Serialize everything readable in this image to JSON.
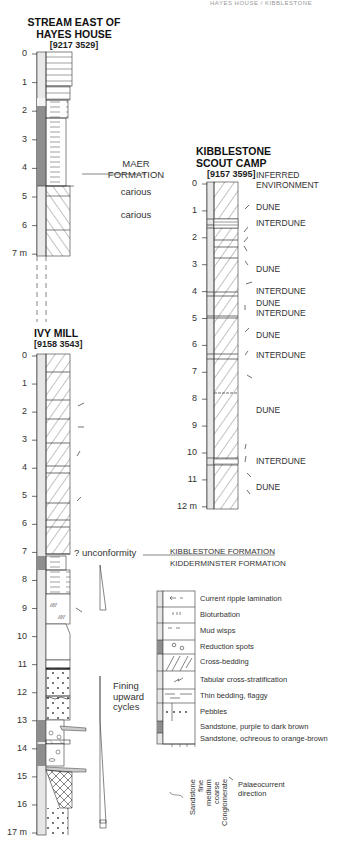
{
  "running_header": "HAYES HOUSE / KIBBLESTONE",
  "columns": [
    {
      "id": "stream-east",
      "title_lines": [
        "STREAM EAST OF",
        "HAYES HOUSE"
      ],
      "grid_ref": "[9217 3529]",
      "ticks": [
        "0",
        "1",
        "2",
        "3",
        "4",
        "5",
        "6",
        "7 m"
      ]
    },
    {
      "id": "ivy-mill",
      "title_lines": [
        "IVY MILL"
      ],
      "grid_ref": "[9158 3543]",
      "ticks": [
        "0",
        "1",
        "2",
        "3",
        "4",
        "5",
        "6",
        "7",
        "8",
        "9",
        "10",
        "11",
        "12",
        "13",
        "14",
        "15",
        "16",
        "17 m"
      ]
    },
    {
      "id": "kibblestone",
      "title_lines": [
        "KIBBLESTONE",
        "SCOUT CAMP"
      ],
      "grid_ref": "[9157 3595]",
      "ticks": [
        "0",
        "1",
        "2",
        "3",
        "4",
        "5",
        "6",
        "7",
        "8",
        "9",
        "10",
        "11",
        "12 m"
      ]
    }
  ],
  "annotations": {
    "maer_formation_lines": [
      "MAER",
      "FORMATION"
    ],
    "carious_1": "carious",
    "carious_2": "carious",
    "unconformity": "? unconformity",
    "kibblestone_formation": "KIBBLESTONE FORMATION",
    "kidderminster_formation": "KIDDERMINSTER FORMATION",
    "fining_upward": [
      "Fining",
      "upward",
      "cycles"
    ],
    "inferred_environment": [
      "INFERRED",
      "ENVIRONMENT"
    ]
  },
  "environments": [
    {
      "label": "DUNE",
      "depth": 0.9
    },
    {
      "label": "INTERDUNE",
      "depth": 1.5
    },
    {
      "label": "DUNE",
      "depth": 3.2
    },
    {
      "label": "INTERDUNE",
      "depth": 4.0
    },
    {
      "label": "DUNE",
      "depth": 4.45
    },
    {
      "label": "INTERDUNE",
      "depth": 4.85
    },
    {
      "label": "DUNE",
      "depth": 5.65
    },
    {
      "label": "INTERDUNE",
      "depth": 6.4
    },
    {
      "label": "DUNE",
      "depth": 8.45
    },
    {
      "label": "INTERDUNE",
      "depth": 10.35
    },
    {
      "label": "DUNE",
      "depth": 11.3
    }
  ],
  "legend": {
    "items": [
      "Current ripple lamination",
      "Bioturbation",
      "Mud wisps",
      "Reduction spots",
      "Cross-bedding",
      "Tabular cross-stratification",
      "Thin bedding, flaggy",
      "Pebbles",
      "Sandstone, purple to dark brown",
      "Sandstone, ochreous to orange-brown"
    ],
    "grain_size_labels": [
      "fine",
      "medium",
      "coarse"
    ],
    "sandstone_label": "Sandstone",
    "conglomerate_label": "Conglomerate",
    "palaeocurrent_lines": [
      "Palaeocurrent",
      "direction"
    ]
  },
  "colors": {
    "line": "#333333",
    "ochre_fill": "#dcdcdc",
    "purple_fill": "#9a9a9a",
    "pale_fill": "#ececec"
  }
}
